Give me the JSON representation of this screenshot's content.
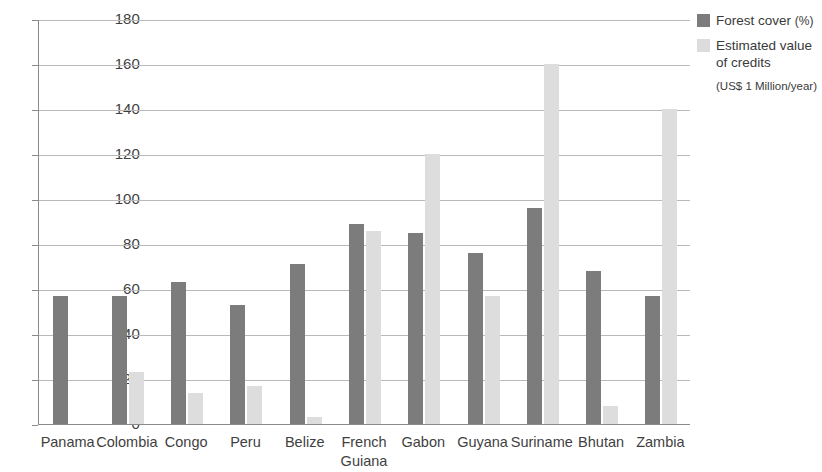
{
  "chart_data": {
    "type": "bar",
    "title": "",
    "xlabel": "",
    "ylabel": "",
    "ylim": [
      0,
      180
    ],
    "ytick_step": 20,
    "yticks": [
      0,
      20,
      40,
      60,
      80,
      100,
      120,
      140,
      160,
      180
    ],
    "grid": true,
    "legend_position": "right",
    "categories": [
      "Panama",
      "Colombia",
      "Congo",
      "Peru",
      "Belize",
      "French\nGuiana",
      "Gabon",
      "Guyana",
      "Suriname",
      "Bhutan",
      "Zambia"
    ],
    "series": [
      {
        "name": "Forest cover (%)",
        "color": "#7c7c7c",
        "values": [
          57,
          57,
          63,
          53,
          71,
          89,
          85,
          76,
          96,
          68,
          57
        ]
      },
      {
        "name": "Estimated value of credits (US$ 1 Million/year)",
        "color": "#dddddd",
        "values": [
          0,
          23,
          14,
          17,
          3,
          86,
          120,
          57,
          160,
          8,
          140
        ]
      }
    ]
  },
  "legend": {
    "items": [
      {
        "swatch": "dark",
        "label": "Forest cover",
        "unit": "(%)",
        "note": ""
      },
      {
        "swatch": "light",
        "label": "Estimated value",
        "label_line2": "of credits",
        "note": "(US$ 1 Million/year)"
      }
    ]
  }
}
